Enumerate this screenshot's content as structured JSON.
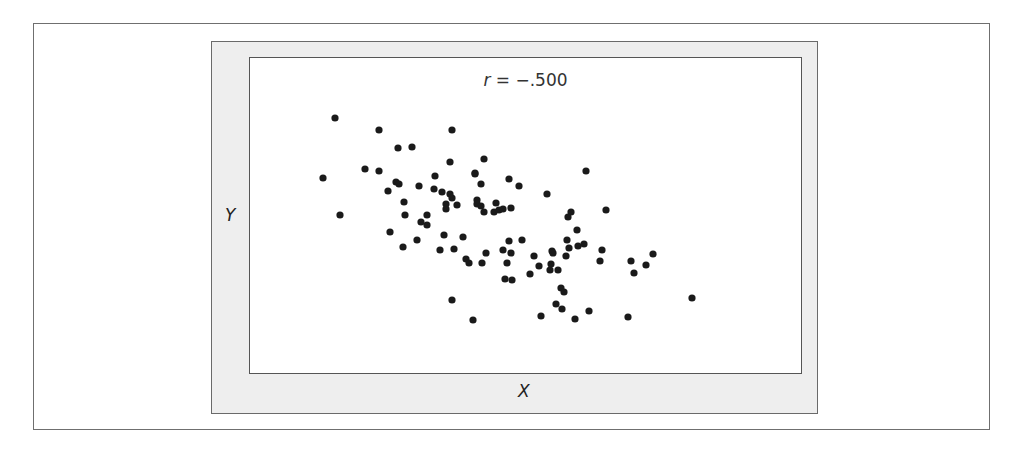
{
  "chart_data": {
    "type": "scatter",
    "title": "r = −.500",
    "title_parts": {
      "variable": "r",
      "rest": " = −.500"
    },
    "xlabel": "X",
    "ylabel": "Y",
    "correlation": -0.5,
    "grid": false,
    "legend": null,
    "axis_ticks": false,
    "marker_color": "#1a1a1a",
    "panel_color": "#eeeeee",
    "coordinate_space": "screen pixels (x right, y down) — no numeric axis scale shown",
    "points": [
      [
        335,
        118
      ],
      [
        379,
        130
      ],
      [
        452,
        130
      ],
      [
        398,
        148
      ],
      [
        412,
        147
      ],
      [
        450,
        162
      ],
      [
        323,
        178
      ],
      [
        365,
        169
      ],
      [
        379,
        171
      ],
      [
        435,
        176
      ],
      [
        396,
        182
      ],
      [
        399,
        184
      ],
      [
        388,
        191
      ],
      [
        419,
        186
      ],
      [
        434,
        189
      ],
      [
        442,
        192
      ],
      [
        450,
        194
      ],
      [
        452,
        198
      ],
      [
        404,
        202
      ],
      [
        446,
        204
      ],
      [
        446,
        209
      ],
      [
        457,
        205
      ],
      [
        340,
        215
      ],
      [
        405,
        215
      ],
      [
        427,
        215
      ],
      [
        484,
        159
      ],
      [
        475,
        173
      ],
      [
        481,
        184
      ],
      [
        475,
        174
      ],
      [
        509,
        179
      ],
      [
        519,
        186
      ],
      [
        586,
        171
      ],
      [
        547,
        194
      ],
      [
        477,
        200
      ],
      [
        477,
        204
      ],
      [
        481,
        206
      ],
      [
        484,
        212
      ],
      [
        496,
        203
      ],
      [
        494,
        212
      ],
      [
        499,
        210
      ],
      [
        503,
        209
      ],
      [
        511,
        208
      ],
      [
        421,
        222
      ],
      [
        427,
        225
      ],
      [
        390,
        232
      ],
      [
        403,
        247
      ],
      [
        417,
        240
      ],
      [
        444,
        235
      ],
      [
        463,
        237
      ],
      [
        440,
        250
      ],
      [
        454,
        249
      ],
      [
        466,
        259
      ],
      [
        469,
        263
      ],
      [
        482,
        263
      ],
      [
        486,
        253
      ],
      [
        503,
        250
      ],
      [
        509,
        241
      ],
      [
        522,
        240
      ],
      [
        511,
        253
      ],
      [
        507,
        263
      ],
      [
        505,
        279
      ],
      [
        512,
        280
      ],
      [
        534,
        256
      ],
      [
        530,
        274
      ],
      [
        571,
        212
      ],
      [
        568,
        217
      ],
      [
        606,
        210
      ],
      [
        577,
        230
      ],
      [
        567,
        240
      ],
      [
        569,
        248
      ],
      [
        578,
        246
      ],
      [
        584,
        244
      ],
      [
        602,
        250
      ],
      [
        600,
        261
      ],
      [
        552,
        251
      ],
      [
        553,
        253
      ],
      [
        566,
        256
      ],
      [
        539,
        266
      ],
      [
        551,
        264
      ],
      [
        550,
        270
      ],
      [
        558,
        270
      ],
      [
        631,
        261
      ],
      [
        653,
        254
      ],
      [
        646,
        265
      ],
      [
        634,
        273
      ],
      [
        561,
        288
      ],
      [
        564,
        292
      ],
      [
        556,
        304
      ],
      [
        562,
        309
      ],
      [
        589,
        311
      ],
      [
        541,
        316
      ],
      [
        575,
        319
      ],
      [
        628,
        317
      ],
      [
        452,
        300
      ],
      [
        473,
        320
      ],
      [
        692,
        298
      ]
    ]
  }
}
